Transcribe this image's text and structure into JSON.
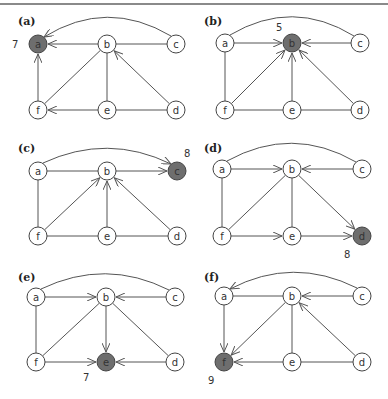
{
  "figure": {
    "top_rule": true,
    "colors": {
      "edge": "#555555",
      "node_fill": "#ffffff",
      "node_stroke": "#444444",
      "highlight_fill": "#6e6e6e",
      "text": "#333333"
    },
    "node_radius": 9,
    "panels": [
      {
        "id": "a",
        "label": "(a)",
        "label_pos": [
          18,
          25
        ],
        "nodes": {
          "a": [
            38,
            44
          ],
          "b": [
            107,
            44
          ],
          "c": [
            176,
            44
          ],
          "f": [
            38,
            110
          ],
          "e": [
            107,
            110
          ],
          "d": [
            176,
            110
          ]
        },
        "highlight": "a",
        "value": "7",
        "value_pos": [
          12,
          48
        ],
        "arc": {
          "from": "c",
          "to": "a",
          "directed": true,
          "peak": 10
        },
        "edges": [
          {
            "from": "b",
            "to": "a",
            "directed": true
          },
          {
            "from": "b",
            "to": "c",
            "directed": false
          },
          {
            "from": "f",
            "to": "a",
            "directed": true
          },
          {
            "from": "b",
            "to": "f",
            "directed": false
          },
          {
            "from": "b",
            "to": "e",
            "directed": false
          },
          {
            "from": "d",
            "to": "b",
            "directed": true
          },
          {
            "from": "e",
            "to": "f",
            "directed": true
          },
          {
            "from": "e",
            "to": "d",
            "directed": false
          }
        ]
      },
      {
        "id": "b",
        "label": "(b)",
        "label_pos": [
          204,
          25
        ],
        "nodes": {
          "a": [
            225,
            43
          ],
          "b": [
            292,
            43
          ],
          "c": [
            360,
            43
          ],
          "f": [
            225,
            110
          ],
          "e": [
            292,
            110
          ],
          "d": [
            360,
            110
          ]
        },
        "highlight": "b",
        "value": "5",
        "value_pos": [
          276,
          31
        ],
        "arc": {
          "from": "a",
          "to": "c",
          "directed": false,
          "peak": 10
        },
        "edges": [
          {
            "from": "a",
            "to": "b",
            "directed": true
          },
          {
            "from": "c",
            "to": "b",
            "directed": true
          },
          {
            "from": "a",
            "to": "f",
            "directed": false
          },
          {
            "from": "f",
            "to": "b",
            "directed": true
          },
          {
            "from": "e",
            "to": "b",
            "directed": true
          },
          {
            "from": "d",
            "to": "b",
            "directed": true
          },
          {
            "from": "f",
            "to": "e",
            "directed": false
          },
          {
            "from": "e",
            "to": "d",
            "directed": false
          }
        ]
      },
      {
        "id": "c",
        "label": "(c)",
        "label_pos": [
          18,
          152
        ],
        "nodes": {
          "a": [
            38,
            171
          ],
          "b": [
            107,
            171
          ],
          "c": [
            177,
            171
          ],
          "f": [
            38,
            236
          ],
          "e": [
            107,
            236
          ],
          "d": [
            177,
            236
          ]
        },
        "highlight": "c",
        "value": "8",
        "value_pos": [
          184,
          157
        ],
        "arc": {
          "from": "a",
          "to": "c",
          "directed": true,
          "peak": 145
        },
        "edges": [
          {
            "from": "a",
            "to": "b",
            "directed": false
          },
          {
            "from": "b",
            "to": "c",
            "directed": true
          },
          {
            "from": "a",
            "to": "f",
            "directed": false
          },
          {
            "from": "f",
            "to": "b",
            "directed": true
          },
          {
            "from": "e",
            "to": "b",
            "directed": true
          },
          {
            "from": "d",
            "to": "b",
            "directed": true
          },
          {
            "from": "f",
            "to": "e",
            "directed": false
          },
          {
            "from": "e",
            "to": "d",
            "directed": false
          }
        ]
      },
      {
        "id": "d",
        "label": "(d)",
        "label_pos": [
          204,
          152
        ],
        "nodes": {
          "a": [
            222,
            169
          ],
          "b": [
            292,
            169
          ],
          "c": [
            362,
            169
          ],
          "f": [
            222,
            236
          ],
          "e": [
            292,
            236
          ],
          "d": [
            362,
            236
          ]
        },
        "highlight": "d",
        "value": "8",
        "value_pos": [
          344,
          258
        ],
        "arc": {
          "from": "a",
          "to": "c",
          "directed": false,
          "peak": 137
        },
        "edges": [
          {
            "from": "a",
            "to": "b",
            "directed": true
          },
          {
            "from": "c",
            "to": "b",
            "directed": true
          },
          {
            "from": "a",
            "to": "f",
            "directed": false
          },
          {
            "from": "b",
            "to": "f",
            "directed": false
          },
          {
            "from": "b",
            "to": "e",
            "directed": false
          },
          {
            "from": "b",
            "to": "d",
            "directed": true
          },
          {
            "from": "f",
            "to": "e",
            "directed": true
          },
          {
            "from": "e",
            "to": "d",
            "directed": true
          }
        ]
      },
      {
        "id": "e",
        "label": "(e)",
        "label_pos": [
          18,
          281
        ],
        "nodes": {
          "a": [
            36,
            297
          ],
          "b": [
            106,
            297
          ],
          "c": [
            175,
            297
          ],
          "f": [
            36,
            362
          ],
          "e": [
            106,
            362
          ],
          "d": [
            175,
            362
          ]
        },
        "highlight": "e",
        "value": "7",
        "value_pos": [
          83,
          381
        ],
        "arc": {
          "from": "a",
          "to": "c",
          "directed": false,
          "peak": 270
        },
        "edges": [
          {
            "from": "a",
            "to": "b",
            "directed": true
          },
          {
            "from": "c",
            "to": "b",
            "directed": true
          },
          {
            "from": "a",
            "to": "f",
            "directed": false
          },
          {
            "from": "b",
            "to": "f",
            "directed": false
          },
          {
            "from": "b",
            "to": "e",
            "directed": true
          },
          {
            "from": "b",
            "to": "d",
            "directed": false
          },
          {
            "from": "f",
            "to": "e",
            "directed": true
          },
          {
            "from": "d",
            "to": "e",
            "directed": true
          }
        ]
      },
      {
        "id": "f",
        "label": "(f)",
        "label_pos": [
          204,
          281
        ],
        "nodes": {
          "a": [
            224,
            296
          ],
          "b": [
            292,
            296
          ],
          "c": [
            362,
            296
          ],
          "f": [
            224,
            362
          ],
          "e": [
            292,
            362
          ],
          "d": [
            362,
            362
          ]
        },
        "highlight": "f",
        "value": "9",
        "value_pos": [
          208,
          384
        ],
        "arc": {
          "from": "c",
          "to": "a",
          "directed": true,
          "peak": 268
        },
        "edges": [
          {
            "from": "a",
            "to": "b",
            "directed": false
          },
          {
            "from": "c",
            "to": "b",
            "directed": true
          },
          {
            "from": "a",
            "to": "f",
            "directed": true
          },
          {
            "from": "b",
            "to": "f",
            "directed": true
          },
          {
            "from": "b",
            "to": "e",
            "directed": false
          },
          {
            "from": "d",
            "to": "b",
            "directed": true
          },
          {
            "from": "e",
            "to": "f",
            "directed": true
          },
          {
            "from": "e",
            "to": "d",
            "directed": false
          }
        ]
      }
    ]
  }
}
